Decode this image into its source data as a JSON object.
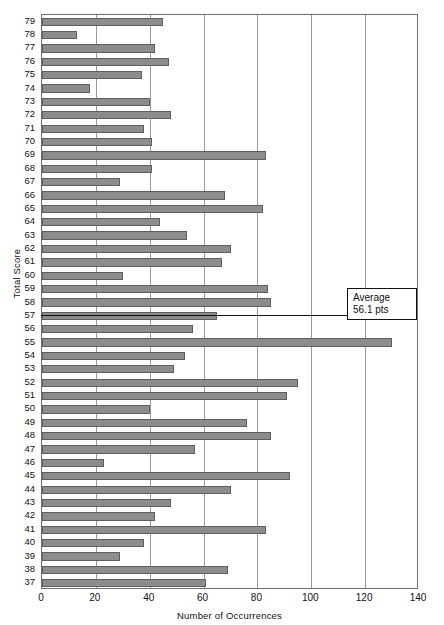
{
  "chart_data": {
    "type": "bar",
    "orientation": "horizontal",
    "title": "",
    "xlabel": "Number of Occurrences",
    "ylabel": "Total Score",
    "xlim": [
      0,
      140
    ],
    "ylim_categories": [
      79,
      37
    ],
    "xticks": [
      0,
      20,
      40,
      60,
      80,
      100,
      120,
      140
    ],
    "grid": "vertical",
    "legend": null,
    "bar_color": "#8c8c8c",
    "bar_edge_color": "#5f5f5f",
    "categories": [
      79,
      78,
      77,
      76,
      75,
      74,
      73,
      72,
      71,
      70,
      69,
      68,
      67,
      66,
      65,
      64,
      63,
      62,
      61,
      60,
      59,
      58,
      57,
      56,
      55,
      54,
      53,
      52,
      51,
      50,
      49,
      48,
      47,
      46,
      45,
      44,
      43,
      42,
      41,
      40,
      39,
      38,
      37
    ],
    "values": [
      45,
      13,
      42,
      47,
      37,
      18,
      40,
      48,
      38,
      41,
      83,
      41,
      29,
      68,
      82,
      44,
      54,
      70,
      67,
      30,
      84,
      85,
      65,
      56,
      130,
      53,
      49,
      95,
      91,
      40,
      76,
      85,
      57,
      23,
      92,
      70,
      48,
      42,
      83,
      38,
      29,
      69,
      61
    ],
    "annotations": [
      {
        "name": "average-callout",
        "line1": "Average",
        "line2": "56.1 pts",
        "points_to_category": 57,
        "value": 56.1
      }
    ]
  },
  "axes": {
    "y_title": "Total Score",
    "x_title": "Number of Occurrences",
    "x_tick_labels": [
      "0",
      "20",
      "40",
      "60",
      "80",
      "100",
      "120",
      "140"
    ],
    "y_tick_labels": [
      "79",
      "78",
      "77",
      "76",
      "75",
      "74",
      "73",
      "72",
      "71",
      "70",
      "69",
      "68",
      "67",
      "66",
      "65",
      "64",
      "63",
      "62",
      "61",
      "60",
      "59",
      "58",
      "57",
      "56",
      "55",
      "54",
      "53",
      "52",
      "51",
      "50",
      "49",
      "48",
      "47",
      "46",
      "45",
      "44",
      "43",
      "42",
      "41",
      "40",
      "39",
      "38",
      "37"
    ]
  },
  "annotation": {
    "line1": "Average",
    "line2": "56.1 pts"
  },
  "title": {
    "text": ""
  }
}
